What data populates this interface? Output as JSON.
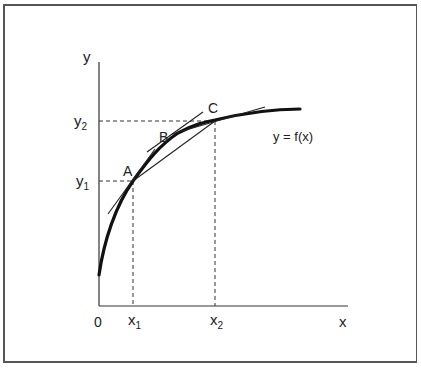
{
  "diagram": {
    "axes": {
      "x_label": "x",
      "y_label": "y",
      "origin_label": "0"
    },
    "ticks": {
      "x": [
        {
          "label": "x",
          "sub": "1"
        },
        {
          "label": "x",
          "sub": "2"
        }
      ],
      "y": [
        {
          "label": "y",
          "sub": "1"
        },
        {
          "label": "y",
          "sub": "2"
        }
      ]
    },
    "points": [
      {
        "label": "A"
      },
      {
        "label": "B"
      },
      {
        "label": "C"
      }
    ],
    "curve_label": "y = f(x)",
    "colors": {
      "line": "#222222",
      "frame": "#555555",
      "background": "#ffffff"
    }
  }
}
